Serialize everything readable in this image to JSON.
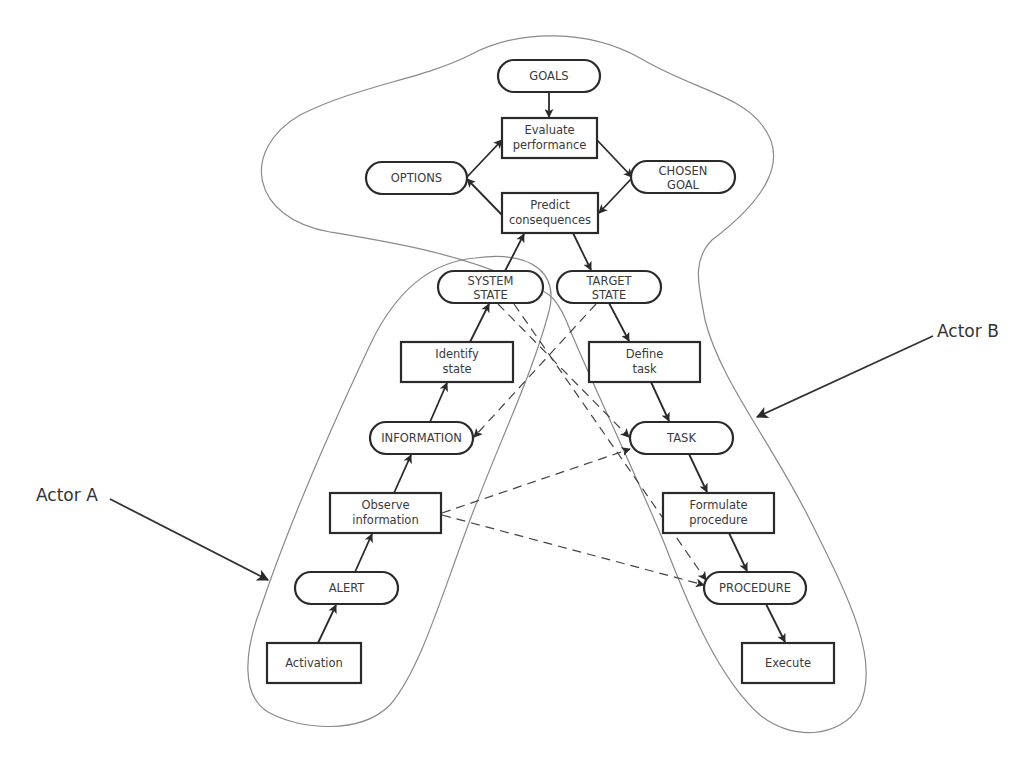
{
  "diagram": {
    "title": "",
    "actors": [
      {
        "id": "actor-a",
        "label": "Actor A"
      },
      {
        "id": "actor-b",
        "label": "Actor B"
      }
    ],
    "nodes": {
      "goals": {
        "shape": "pill",
        "lines": [
          "GOALS"
        ]
      },
      "evaluate": {
        "shape": "box",
        "lines": [
          "Evaluate",
          "performance"
        ]
      },
      "options": {
        "shape": "pill",
        "lines": [
          "OPTIONS"
        ]
      },
      "chosen_goal": {
        "shape": "pill",
        "lines": [
          "CHOSEN",
          "GOAL"
        ]
      },
      "predict": {
        "shape": "box",
        "lines": [
          "Predict",
          "consequences"
        ]
      },
      "system_state": {
        "shape": "pill",
        "lines": [
          "SYSTEM",
          "STATE"
        ]
      },
      "target_state": {
        "shape": "pill",
        "lines": [
          "TARGET",
          "STATE"
        ]
      },
      "identify": {
        "shape": "box",
        "lines": [
          "Identify",
          "state"
        ]
      },
      "define": {
        "shape": "box",
        "lines": [
          "Define",
          "task"
        ]
      },
      "information": {
        "shape": "pill",
        "lines": [
          "INFORMATION"
        ]
      },
      "task": {
        "shape": "pill",
        "lines": [
          "TASK"
        ]
      },
      "observe": {
        "shape": "box",
        "lines": [
          "Observe",
          "information"
        ]
      },
      "formulate": {
        "shape": "box",
        "lines": [
          "Formulate",
          "procedure"
        ]
      },
      "alert": {
        "shape": "pill",
        "lines": [
          "ALERT"
        ]
      },
      "procedure": {
        "shape": "pill",
        "lines": [
          "PROCEDURE"
        ]
      },
      "activation": {
        "shape": "box",
        "lines": [
          "Activation"
        ]
      },
      "execute": {
        "shape": "box",
        "lines": [
          "Execute"
        ]
      }
    },
    "edges_solid": [
      [
        "goals",
        "evaluate"
      ],
      [
        "evaluate",
        "chosen_goal"
      ],
      [
        "chosen_goal",
        "predict"
      ],
      [
        "predict",
        "options"
      ],
      [
        "options",
        "evaluate"
      ],
      [
        "system_state",
        "predict"
      ],
      [
        "predict",
        "target_state"
      ],
      [
        "identify",
        "system_state"
      ],
      [
        "target_state",
        "define"
      ],
      [
        "information",
        "identify"
      ],
      [
        "define",
        "task"
      ],
      [
        "observe",
        "information"
      ],
      [
        "task",
        "formulate"
      ],
      [
        "alert",
        "observe"
      ],
      [
        "formulate",
        "procedure"
      ],
      [
        "activation",
        "alert"
      ],
      [
        "procedure",
        "execute"
      ]
    ],
    "edges_dashed": [
      [
        "system_state",
        "task"
      ],
      [
        "system_state",
        "procedure"
      ],
      [
        "target_state",
        "information"
      ],
      [
        "observe",
        "task"
      ],
      [
        "observe",
        "procedure"
      ]
    ]
  }
}
